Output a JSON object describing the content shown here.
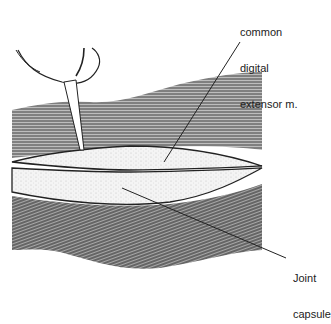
{
  "figure": {
    "labels": {
      "extensor_line1": "common",
      "extensor_line2": "digital",
      "extensor_line3": "extensor m.",
      "capsule_line1": "Joint",
      "capsule_line2": "capsule"
    }
  }
}
